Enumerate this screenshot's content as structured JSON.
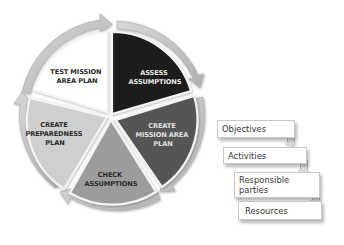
{
  "cycle": {
    "segments": [
      {
        "id": "assess",
        "lines": [
          "ASSESS",
          "ASSUMPTIONS"
        ],
        "fill": "#1c1c1c",
        "text_color": "#e8e8e8"
      },
      {
        "id": "create-mission",
        "lines": [
          "CREATE",
          "MISSION AREA",
          "PLAN"
        ],
        "fill": "#545454",
        "text_color": "#e0e0e0"
      },
      {
        "id": "check",
        "lines": [
          "CHECK",
          "ASSUMPTIONS"
        ],
        "fill": "#9c9c9c",
        "text_color": "#2a2a2a"
      },
      {
        "id": "create-preparedness",
        "lines": [
          "CREATE",
          "PREPAREDNESS",
          "PLAN"
        ],
        "fill": "#cfcfcf",
        "text_color": "#2a2a2a"
      },
      {
        "id": "test-mission",
        "lines": [
          "TEST MISSION",
          "AREA PLAN"
        ],
        "fill": "#ffffff",
        "text_color": "#2a2a2a"
      }
    ],
    "ring_color": "#c4c4c4"
  },
  "steps": {
    "items": [
      {
        "label": "Objectives"
      },
      {
        "label": "Activities"
      },
      {
        "label": "Responsible parties",
        "line1": "Responsible",
        "line2": "parties"
      },
      {
        "label": "Resources"
      }
    ]
  }
}
